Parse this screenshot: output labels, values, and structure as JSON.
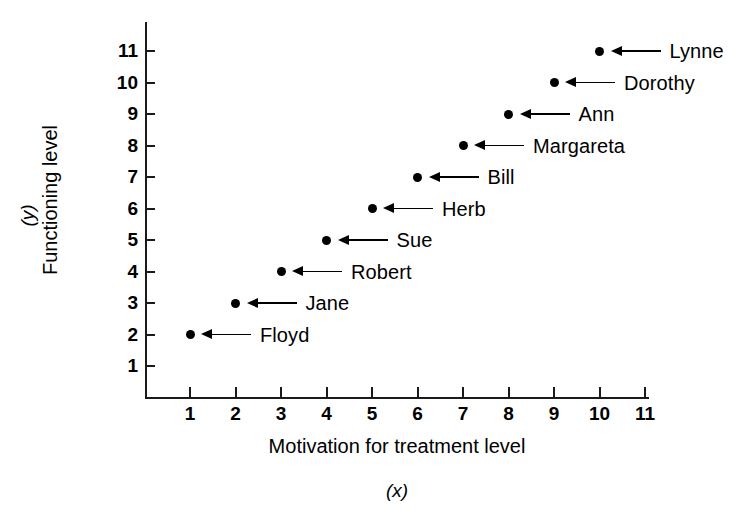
{
  "chart_data": {
    "type": "scatter",
    "title": "",
    "xlabel": "Motivation for treatment level",
    "xvar": "(x)",
    "ylabel": "Functioning level",
    "yvar": "(y)",
    "xlim": [
      0,
      11
    ],
    "ylim": [
      0,
      11
    ],
    "xticks": [
      "1",
      "2",
      "3",
      "4",
      "5",
      "6",
      "7",
      "8",
      "9",
      "10",
      "11"
    ],
    "yticks": [
      "1",
      "2",
      "3",
      "4",
      "5",
      "6",
      "7",
      "8",
      "9",
      "10",
      "11"
    ],
    "grid": false,
    "legend": "none",
    "x": [
      1,
      2,
      3,
      4,
      5,
      6,
      7,
      8,
      9,
      10
    ],
    "y": [
      2,
      3,
      4,
      5,
      6,
      7,
      8,
      9,
      10,
      11
    ],
    "point_labels": [
      "Floyd",
      "Jane",
      "Robert",
      "Sue",
      "Herb",
      "Bill",
      "Margareta",
      "Ann",
      "Dorothy",
      "Lynne"
    ],
    "points": [
      {
        "label": "Floyd",
        "x": 1,
        "y": 2
      },
      {
        "label": "Jane",
        "x": 2,
        "y": 3
      },
      {
        "label": "Robert",
        "x": 3,
        "y": 4
      },
      {
        "label": "Sue",
        "x": 4,
        "y": 5
      },
      {
        "label": "Herb",
        "x": 5,
        "y": 6
      },
      {
        "label": "Bill",
        "x": 6,
        "y": 7
      },
      {
        "label": "Margareta",
        "x": 7,
        "y": 8
      },
      {
        "label": "Ann",
        "x": 8,
        "y": 9
      },
      {
        "label": "Dorothy",
        "x": 9,
        "y": 10
      },
      {
        "label": "Lynne",
        "x": 10,
        "y": 11
      }
    ],
    "marker_color": "#000000",
    "axis_color": "#1a1a1a",
    "background_color": "#ffffff"
  }
}
